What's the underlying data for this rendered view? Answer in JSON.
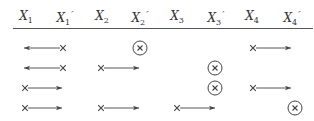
{
  "headers": [
    {
      "base": "X",
      "sub": "1",
      "prime": "",
      "x": 26
    },
    {
      "base": "X",
      "sub": "1",
      "prime": "′",
      "x": 65
    },
    {
      "base": "X",
      "sub": "2",
      "prime": "",
      "x": 102
    },
    {
      "base": "X",
      "sub": "2",
      "prime": "′",
      "x": 140
    },
    {
      "base": "X",
      "sub": "3",
      "prime": "",
      "x": 177
    },
    {
      "base": "X",
      "sub": "3",
      "prime": "′",
      "x": 216
    },
    {
      "base": "X",
      "sub": "4",
      "prime": "",
      "x": 252
    },
    {
      "base": "X",
      "sub": "4",
      "prime": "′",
      "x": 292
    }
  ],
  "rows": [
    {
      "y": 48,
      "marks": [
        {
          "type": "arrow-left",
          "from": 63,
          "to": 24
        },
        {
          "type": "circled-x",
          "x": 140
        },
        {
          "type": "arrow-right",
          "from": 253,
          "to": 291
        }
      ]
    },
    {
      "y": 68,
      "marks": [
        {
          "type": "arrow-left",
          "from": 63,
          "to": 24
        },
        {
          "type": "arrow-right",
          "from": 101,
          "to": 139
        },
        {
          "type": "circled-x",
          "x": 215
        }
      ]
    },
    {
      "y": 88,
      "marks": [
        {
          "type": "arrow-right",
          "from": 25,
          "to": 62
        },
        {
          "type": "circled-x",
          "x": 215
        },
        {
          "type": "arrow-right",
          "from": 253,
          "to": 291
        }
      ]
    },
    {
      "y": 108,
      "marks": [
        {
          "type": "arrow-right",
          "from": 25,
          "to": 62
        },
        {
          "type": "arrow-right",
          "from": 101,
          "to": 139
        },
        {
          "type": "arrow-right",
          "from": 177,
          "to": 215
        },
        {
          "type": "circled-x",
          "x": 295
        }
      ]
    }
  ],
  "colors": {
    "ink": "#444444"
  }
}
